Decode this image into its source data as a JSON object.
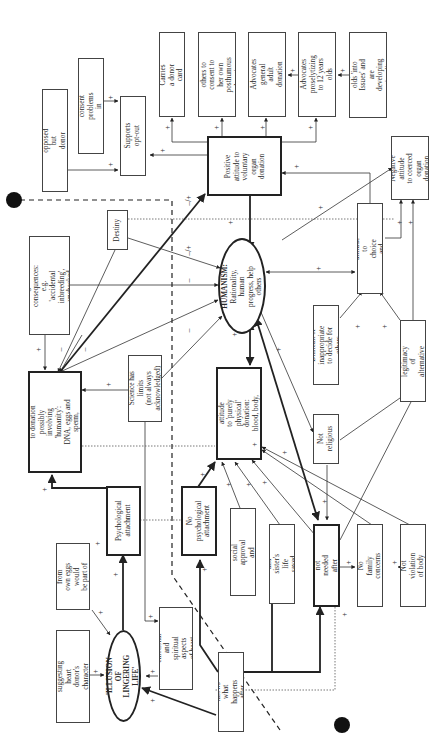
{
  "diagram": {
    "central": {
      "humanism": {
        "title": "HUMANISM:",
        "text": "Rationality, human\nprogress, help others"
      },
      "illusion": {
        "title": "'ILLUSION OF\nLINGERING LIFE'"
      }
    },
    "nodes": {
      "many_people": "Many people not opposed\nbut donor cards hard to get",
      "next_of_kin": "Next of kin consent\nproblems in system now",
      "supports_optout": "Supports opt-out",
      "carries_card": "Carries a donor card",
      "desires_consent": "Desires others to\nconsent to her own\nposthumous donation",
      "advocates_adult": "Advocates general\nadult donation",
      "advocates_12": "Advocates\nproselytizing\nto 12 years olds",
      "twelve_year_olds": "12 years olds 'into\nIssues' and are\ndeveloping rationality",
      "positive_voluntary": "Positive\nattitude to\nvoluntary\norgan\ndonation",
      "negative_coerced": "Negative attitude\nto coerced\norgan donation",
      "destiny": "Destiny",
      "unknown_consequences": "Unknown and/or negative\nconsequences: e.g.\n'accidental inbreeding',\nunchecked amoral science",
      "positive_choice": "Positive attitude to\nchoice and autonomy",
      "difficult_decide": "Difficult or inappropriate\nto decide for others",
      "accepts_legitimacy": "Accepts legitimacy\nof alternative views",
      "reluctant_negative": "Reluctant negative attitude\nto donation possibly\ninvolving 'humanity':\nDNA, eggs and sperm,\nheart, xenotransplantation",
      "science_limits": "Science has limits\n(not always\nacknowledged)",
      "positive_physical": "Positive attitude\nto 'purely physical'\ndonation: blood, body,\nmost organs",
      "not_religious": "Not religious",
      "psych_attachment": "Psychological\nattachment",
      "no_psych_attachment": "No psychological\nattachment",
      "widespread_social": "Widespread social\napproval and modelling",
      "own_sister": "Own and sister's\nlife saved in past",
      "body_not_needed": "Body not needed\nafter death",
      "no_family": "No family concerns",
      "not_violation": "Not violation of body",
      "children_eggs": "Children from\nown eggs would\nbe part of me",
      "unknown_emotional": "Unknown emotional\nand spiritual aspects\nof heart donation",
      "media_cases": "Media cases suggesting\nheart donor's character\ninfluences recipient",
      "nobody_knows": "Nobody knows what\nhappens after death"
    },
    "link_labels": {
      "plus": "+",
      "minus": "–",
      "minus_plus": "–/+"
    },
    "colors": {
      "line": "#222222",
      "box_border": "#444444",
      "background": "#ffffff"
    }
  }
}
